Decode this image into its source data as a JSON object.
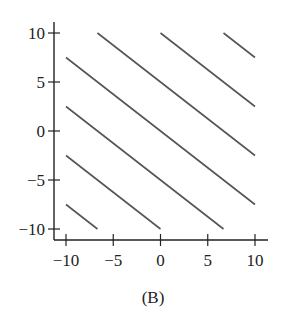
{
  "chart_data": {
    "type": "line",
    "title": "",
    "caption": "(B)",
    "xlabel": "",
    "ylabel": "",
    "xlim": [
      -10,
      10
    ],
    "ylim": [
      -10,
      10
    ],
    "x_ticks": [
      -10,
      -5,
      0,
      5,
      10
    ],
    "y_ticks": [
      -10,
      -5,
      0,
      5,
      10
    ],
    "x_tick_labels": [
      "−10",
      "−5",
      "0",
      "5",
      "10"
    ],
    "y_tick_labels": [
      "−10",
      "−5",
      "0",
      "5",
      "10"
    ],
    "grid": false,
    "legend": null,
    "slope": -0.75,
    "intercepts": [
      -15,
      -10,
      -5,
      0,
      5,
      10,
      15
    ],
    "series": [
      {
        "name": "c=-15",
        "x": [
          -10,
          -6.67
        ],
        "y": [
          -7.5,
          -10
        ]
      },
      {
        "name": "c=-10",
        "x": [
          -10,
          0
        ],
        "y": [
          -2.5,
          -10
        ]
      },
      {
        "name": "c=-5",
        "x": [
          -10,
          6.67
        ],
        "y": [
          2.5,
          -10
        ]
      },
      {
        "name": "c=0",
        "x": [
          -10,
          10
        ],
        "y": [
          7.5,
          -7.5
        ]
      },
      {
        "name": "c=5",
        "x": [
          -6.67,
          10
        ],
        "y": [
          10,
          -2.5
        ]
      },
      {
        "name": "c=10",
        "x": [
          0,
          10
        ],
        "y": [
          10,
          2.5
        ]
      },
      {
        "name": "c=15",
        "x": [
          6.67,
          10
        ],
        "y": [
          10,
          7.5
        ]
      }
    ],
    "line_color": "#555555"
  }
}
